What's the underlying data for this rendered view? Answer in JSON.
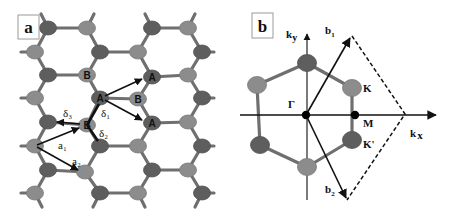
{
  "figure": {
    "panel_a": {
      "label": "a",
      "colors": {
        "light_atom": "#8c8c8c",
        "dark_atom": "#5e5e5e",
        "bond": "#6f6f6f"
      },
      "rows_y": [
        28,
        52,
        75,
        98,
        122,
        146,
        170,
        193
      ],
      "atoms": [
        {
          "x": 48,
          "y": 28,
          "t": "dark"
        },
        {
          "x": 87,
          "y": 28,
          "t": "light"
        },
        {
          "x": 152,
          "y": 28,
          "t": "dark"
        },
        {
          "x": 188,
          "y": 28,
          "t": "light"
        },
        {
          "x": 35,
          "y": 52,
          "t": "light"
        },
        {
          "x": 100,
          "y": 52,
          "t": "dark"
        },
        {
          "x": 138,
          "y": 52,
          "t": "light"
        },
        {
          "x": 202,
          "y": 52,
          "t": "dark"
        },
        {
          "x": 48,
          "y": 75,
          "t": "dark"
        },
        {
          "x": 87,
          "y": 75,
          "t": "light",
          "label": "B"
        },
        {
          "x": 152,
          "y": 77,
          "t": "dark",
          "label": "A"
        },
        {
          "x": 188,
          "y": 75,
          "t": "light"
        },
        {
          "x": 35,
          "y": 98,
          "t": "light"
        },
        {
          "x": 100,
          "y": 98,
          "t": "dark",
          "label": "A"
        },
        {
          "x": 138,
          "y": 99,
          "t": "light",
          "label": "B"
        },
        {
          "x": 202,
          "y": 98,
          "t": "dark"
        },
        {
          "x": 48,
          "y": 122,
          "t": "dark"
        },
        {
          "x": 87,
          "y": 125,
          "t": "light",
          "label": "B"
        },
        {
          "x": 152,
          "y": 123,
          "t": "dark",
          "label": "A"
        },
        {
          "x": 188,
          "y": 122,
          "t": "light"
        },
        {
          "x": 35,
          "y": 146,
          "t": "light"
        },
        {
          "x": 100,
          "y": 146,
          "t": "dark"
        },
        {
          "x": 138,
          "y": 146,
          "t": "light"
        },
        {
          "x": 202,
          "y": 146,
          "t": "dark"
        },
        {
          "x": 48,
          "y": 170,
          "t": "dark"
        },
        {
          "x": 85,
          "y": 172,
          "t": "light"
        },
        {
          "x": 152,
          "y": 170,
          "t": "dark"
        },
        {
          "x": 188,
          "y": 170,
          "t": "light"
        },
        {
          "x": 35,
          "y": 193,
          "t": "light"
        },
        {
          "x": 100,
          "y": 193,
          "t": "dark"
        },
        {
          "x": 138,
          "y": 193,
          "t": "light"
        },
        {
          "x": 202,
          "y": 193,
          "t": "dark"
        }
      ],
      "vector_labels": {
        "delta1": "δ₁",
        "delta2": "δ₂",
        "delta3": "δ₃",
        "a1": "a₁",
        "a2": "a₂"
      },
      "atom_labels": {
        "A": "A",
        "B": "B"
      }
    },
    "panel_b": {
      "label": "b",
      "axes": {
        "kx": "k",
        "kx_sub": "x",
        "ky": "k",
        "ky_sub": "y"
      },
      "points": {
        "gamma": "Γ",
        "M": "M",
        "K": "K",
        "K_prime": "K'"
      },
      "vectors": {
        "b1": "b",
        "b1_sub": "1",
        "b2": "b",
        "b2_sub": "2"
      },
      "origin": [
        306,
        115
      ],
      "hexagon": [
        {
          "x": 307,
          "y": 63,
          "t": "dark"
        },
        {
          "x": 352,
          "y": 88,
          "t": "light",
          "name": "K"
        },
        {
          "x": 352,
          "y": 140,
          "t": "dark",
          "name": "K'"
        },
        {
          "x": 307,
          "y": 167,
          "t": "light"
        },
        {
          "x": 260,
          "y": 145,
          "t": "dark"
        },
        {
          "x": 257,
          "y": 85,
          "t": "light"
        }
      ]
    }
  }
}
